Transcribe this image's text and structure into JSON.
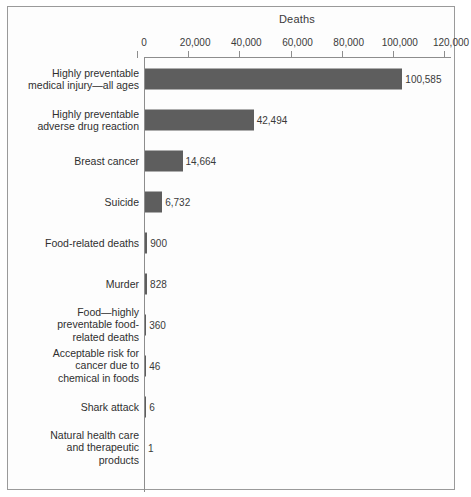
{
  "chart_data": {
    "type": "bar",
    "orientation": "horizontal",
    "title": "Deaths",
    "xlabel": "",
    "ylabel": "",
    "xlim": [
      0,
      120000
    ],
    "xticks": [
      0,
      20000,
      40000,
      60000,
      80000,
      100000,
      120000
    ],
    "xtick_labels": [
      "0",
      "20,000",
      "40,000",
      "60,000",
      "80,000",
      "100,000",
      "120,000"
    ],
    "grid": false,
    "legend": false,
    "bar_color": "#5e5e5e",
    "categories": [
      "Highly preventable medical injury—all ages",
      "Highly preventable adverse drug reaction",
      "Breast cancer",
      "Suicide",
      "Food-related deaths",
      "Murder",
      "Food—highly preventable food-related deaths",
      "Acceptable risk for cancer due to chemical in foods",
      "Shark attack",
      "Natural health care and therapeutic products"
    ],
    "values": [
      100585,
      42494,
      14664,
      6732,
      900,
      828,
      360,
      46,
      6,
      1
    ],
    "value_labels": [
      "100,585",
      "42,494",
      "14,664",
      "6,732",
      "900",
      "828",
      "360",
      "46",
      "6",
      "1"
    ],
    "rows": [
      {
        "label_lines": [
          "Highly preventable",
          "medical injury—all ages"
        ],
        "value": 100585,
        "value_label": "100,585"
      },
      {
        "label_lines": [
          "Highly preventable",
          "adverse drug reaction"
        ],
        "value": 42494,
        "value_label": "42,494"
      },
      {
        "label_lines": [
          "Breast cancer"
        ],
        "value": 14664,
        "value_label": "14,664"
      },
      {
        "label_lines": [
          "Suicide"
        ],
        "value": 6732,
        "value_label": "6,732"
      },
      {
        "label_lines": [
          "Food-related deaths"
        ],
        "value": 900,
        "value_label": "900"
      },
      {
        "label_lines": [
          "Murder"
        ],
        "value": 828,
        "value_label": "828"
      },
      {
        "label_lines": [
          "Food—highly",
          "preventable food-",
          "related deaths"
        ],
        "value": 360,
        "value_label": "360"
      },
      {
        "label_lines": [
          "Acceptable risk for",
          "cancer due to",
          "chemical in foods"
        ],
        "value": 46,
        "value_label": "46"
      },
      {
        "label_lines": [
          "Shark attack"
        ],
        "value": 6,
        "value_label": "6"
      },
      {
        "label_lines": [
          "Natural health care",
          "and therapeutic",
          "products"
        ],
        "value": 1,
        "value_label": "1"
      }
    ]
  }
}
